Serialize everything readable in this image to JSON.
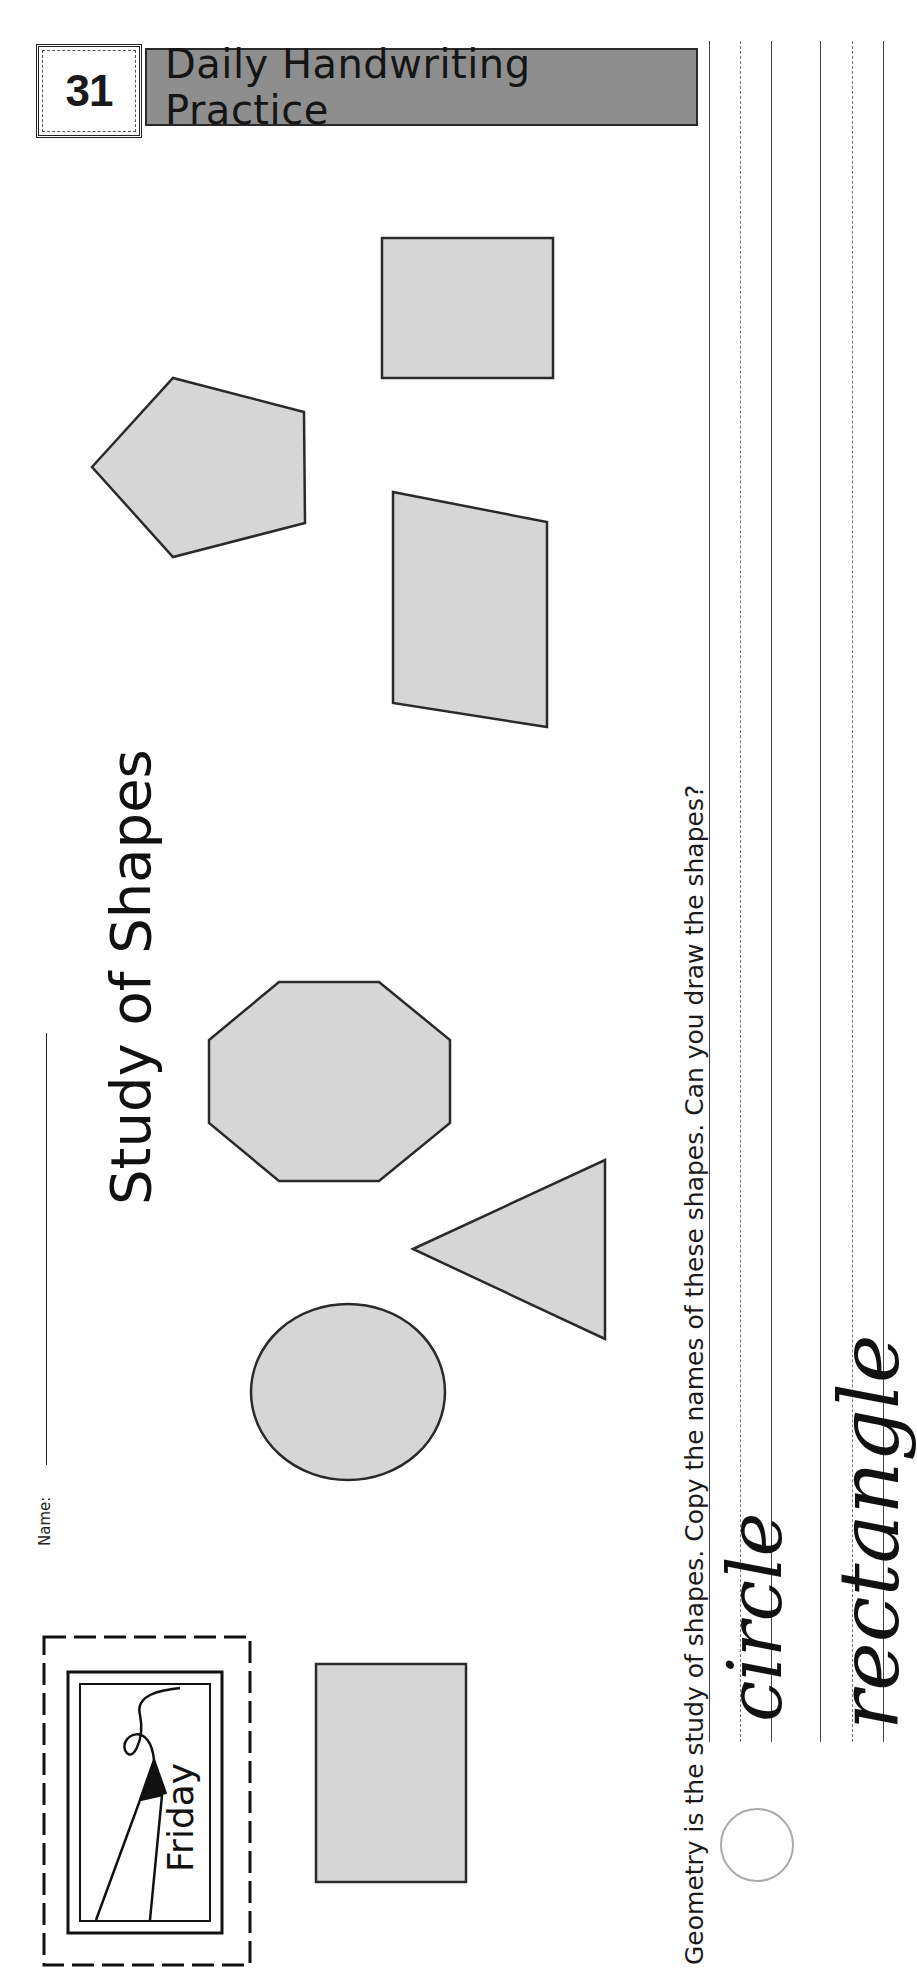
{
  "header": {
    "number": "31",
    "title": "Daily Handwriting Practice"
  },
  "worksheet": {
    "title": "Study of Shapes",
    "name_label": "Name:",
    "day": "Friday",
    "instructions": "Geometry is the study of shapes. Copy the names of these shapes. Can you draw the shapes?",
    "practice_words": [
      "circle",
      "rectangle"
    ]
  },
  "shapes": [
    {
      "type": "square",
      "label": "square"
    },
    {
      "type": "pentagon",
      "label": "pentagon"
    },
    {
      "type": "parallelogram",
      "label": "parallelogram"
    },
    {
      "type": "octagon",
      "label": "octagon"
    },
    {
      "type": "triangle",
      "label": "triangle"
    },
    {
      "type": "circle",
      "label": "circle"
    },
    {
      "type": "rectangle",
      "label": "rectangle"
    }
  ],
  "colors": {
    "shape_fill": "#d6d6d6",
    "shape_stroke": "#2a2a2a",
    "header_bar": "#8e8e8e"
  }
}
